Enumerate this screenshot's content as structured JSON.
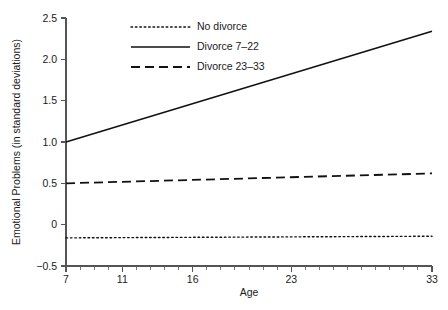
{
  "chart_data": {
    "type": "line",
    "title": "",
    "xlabel": "Age",
    "ylabel": "Emotional Problems (in standard deviations)",
    "xlim": [
      7,
      33
    ],
    "ylim": [
      -0.5,
      2.5
    ],
    "grid": false,
    "legend_position": "top-left",
    "x_ticks": [
      {
        "value": 7,
        "label": "7"
      },
      {
        "value": 8,
        "label": ""
      },
      {
        "value": 9,
        "label": ""
      },
      {
        "value": 10,
        "label": ""
      },
      {
        "value": 11,
        "label": "11"
      },
      {
        "value": 12,
        "label": ""
      },
      {
        "value": 13,
        "label": ""
      },
      {
        "value": 14,
        "label": ""
      },
      {
        "value": 15,
        "label": ""
      },
      {
        "value": 16,
        "label": "16"
      },
      {
        "value": 17,
        "label": ""
      },
      {
        "value": 18,
        "label": ""
      },
      {
        "value": 19,
        "label": ""
      },
      {
        "value": 20,
        "label": ""
      },
      {
        "value": 21,
        "label": ""
      },
      {
        "value": 22,
        "label": ""
      },
      {
        "value": 23,
        "label": "23"
      },
      {
        "value": 24,
        "label": ""
      },
      {
        "value": 25,
        "label": ""
      },
      {
        "value": 26,
        "label": ""
      },
      {
        "value": 27,
        "label": ""
      },
      {
        "value": 28,
        "label": ""
      },
      {
        "value": 29,
        "label": ""
      },
      {
        "value": 30,
        "label": ""
      },
      {
        "value": 31,
        "label": ""
      },
      {
        "value": 32,
        "label": ""
      },
      {
        "value": 33,
        "label": "33"
      }
    ],
    "y_ticks": [
      {
        "value": 2.5,
        "label": "2.5"
      },
      {
        "value": 2.0,
        "label": "2.0"
      },
      {
        "value": 1.5,
        "label": "1.5"
      },
      {
        "value": 1.0,
        "label": "1.0"
      },
      {
        "value": 0.5,
        "label": "0.5"
      },
      {
        "value": 0.0,
        "label": "0"
      },
      {
        "value": -0.5,
        "label": "-0.5"
      }
    ],
    "series": [
      {
        "name": "No divorce",
        "style": "dotted",
        "color": "#111111",
        "x": [
          7,
          33
        ],
        "values": [
          -0.16,
          -0.14
        ]
      },
      {
        "name": "Divorce 7-22",
        "style": "solid",
        "color": "#111111",
        "x": [
          7,
          33
        ],
        "values": [
          1.0,
          2.34
        ]
      },
      {
        "name": "Divorce 23-33",
        "style": "dashed",
        "color": "#111111",
        "x": [
          7,
          33
        ],
        "values": [
          0.5,
          0.62
        ]
      }
    ],
    "legend": [
      {
        "label": "No divorce",
        "style": "dotted"
      },
      {
        "label": "Divorce 7–22",
        "style": "solid"
      },
      {
        "label": "Divorce 23–33",
        "style": "dashed"
      }
    ]
  }
}
